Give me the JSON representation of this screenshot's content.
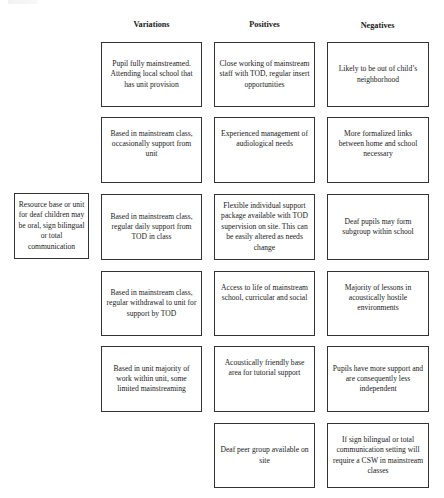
{
  "diagram": {
    "headers": {
      "variations": "Variations",
      "positives": "Positives",
      "negatives": "Negatives"
    },
    "source_box": "Resource base or unit for deaf children may be oral, sign bilingual or total communication",
    "variations": [
      "Pupil fully mainstreamed. Attending local school that has unit provision",
      "Based in mainstream class, occasionally support from unit",
      "Based in mainstream class, regular daily support from TOD in class",
      "Based in mainstream class, regular withdrawal to unit for support by TOD",
      "Based in unit majority of work within unit, some limited mainstreaming"
    ],
    "positives": [
      "Close working of mainstream staff with TOD, regular insert opportunities",
      "Experienced management of audiological needs",
      "Flexible individual support package available with TOD supervision on site. This can be easily altered as needs change",
      "Access to life of mainstream school, curricular and social",
      "Acoustically friendly base area for tutorial support",
      "Deaf peer group available on site"
    ],
    "negatives": [
      "Likely to be out of child’s neighborhood",
      "More formalized links between home and school necessary",
      "Deaf pupils may form subgroup within school",
      "Majority of lessons in acoustically hostile environments",
      "Pupils have more support  and are consequently less independent",
      "If sign bilingual or total communication setting will require a CSW in mainstream classes"
    ]
  }
}
